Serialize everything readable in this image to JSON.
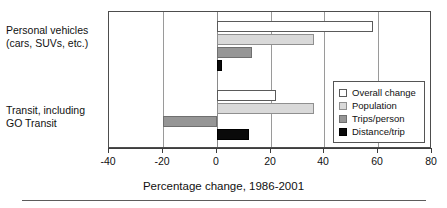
{
  "chart_data": {
    "type": "bar",
    "orientation": "horizontal",
    "title": "",
    "xlabel": "Percentage change, 1986-2001",
    "ylabel": "",
    "xlim": [
      -40,
      80
    ],
    "xticks": [
      -40,
      -20,
      0,
      20,
      40,
      60,
      80
    ],
    "xticklabels": [
      "-40",
      "-20",
      "0",
      "20",
      "40",
      "60",
      "80"
    ],
    "grid": "vertical",
    "legend_position": "center-right-inside",
    "categories": [
      "Personal vehicles\n(cars, SUVs, etc.)",
      "Transit, including\nGO Transit"
    ],
    "series": [
      {
        "name": "Overall change",
        "color": "#ffffff",
        "values": [
          58,
          22
        ]
      },
      {
        "name": "Population",
        "color": "#d9d9d9",
        "values": [
          36,
          36
        ]
      },
      {
        "name": "Trips/person",
        "color": "#969696",
        "values": [
          13,
          -20
        ]
      },
      {
        "name": "Distance/trip",
        "color": "#0a0a0a",
        "values": [
          2,
          12
        ]
      }
    ]
  },
  "axis": {
    "xlabel": "Percentage change, 1986-2001"
  },
  "legend": {
    "items": [
      {
        "label": "Overall change"
      },
      {
        "label": "Population"
      },
      {
        "label": "Trips/person"
      },
      {
        "label": "Distance/trip"
      }
    ]
  },
  "categories": [
    {
      "label": "Personal vehicles\n(cars, SUVs, etc.)"
    },
    {
      "label": "Transit, including\nGO Transit"
    }
  ],
  "ticks": [
    {
      "label": "-40"
    },
    {
      "label": "-20"
    },
    {
      "label": "0"
    },
    {
      "label": "20"
    },
    {
      "label": "40"
    },
    {
      "label": "60"
    },
    {
      "label": "80"
    }
  ],
  "colors": {
    "series_overall_change": "#ffffff",
    "series_population": "#d9d9d9",
    "series_trips_person": "#969696",
    "series_distance_trip": "#0a0a0a",
    "frame": "#4d4d4d",
    "gridline": "#9a9a9a"
  }
}
